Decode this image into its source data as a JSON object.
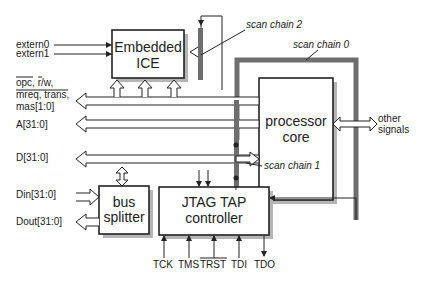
{
  "blocks": {
    "embedded_ice": {
      "line1": "Embedded",
      "line2": "ICE"
    },
    "processor_core": {
      "line1": "processor",
      "line2": "core"
    },
    "bus_splitter": {
      "line1": "bus",
      "line2": "splitter"
    },
    "jtag_tap": {
      "line1": "JTAG TAP",
      "line2": "controller"
    }
  },
  "signals": {
    "extern0": "extern0",
    "extern1": "extern1",
    "ctrl_line1": "opc, r/w,",
    "ctrl_line2": "mreq, trans,",
    "ctrl_line3": "mas[1:0]",
    "address": "A[31:0]",
    "data": "D[31:0]",
    "din": "Din[31:0]",
    "dout": "Dout[31:0]",
    "other_line1": "other",
    "other_line2": "signals"
  },
  "scan_chains": {
    "chain0": "scan chain 0",
    "chain1": "scan chain 1",
    "chain2": "scan chain 2"
  },
  "jtag_pins": [
    "TCK",
    "TMS",
    "TRST",
    "TDI",
    "TDO"
  ],
  "colors": {
    "scan_chain": "#6e6e6e",
    "shadow": "#b5b5b5",
    "stroke": "#222222"
  }
}
